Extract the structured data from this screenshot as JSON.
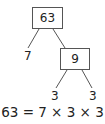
{
  "diagram": {
    "type": "factor-tree",
    "root": {
      "value": "63"
    },
    "nodes": [
      {
        "id": "root",
        "value": "63",
        "boxed": true
      },
      {
        "id": "left-leaf",
        "value": "7",
        "boxed": false
      },
      {
        "id": "mid",
        "value": "9",
        "boxed": true
      },
      {
        "id": "mid-left-leaf",
        "value": "3",
        "boxed": false
      },
      {
        "id": "mid-right-leaf",
        "value": "3",
        "boxed": false
      }
    ],
    "edges": [
      [
        "root",
        "left-leaf"
      ],
      [
        "root",
        "mid"
      ],
      [
        "mid",
        "mid-left-leaf"
      ],
      [
        "mid",
        "mid-right-leaf"
      ]
    ],
    "equation": "63 = 7 × 3 × 3"
  }
}
